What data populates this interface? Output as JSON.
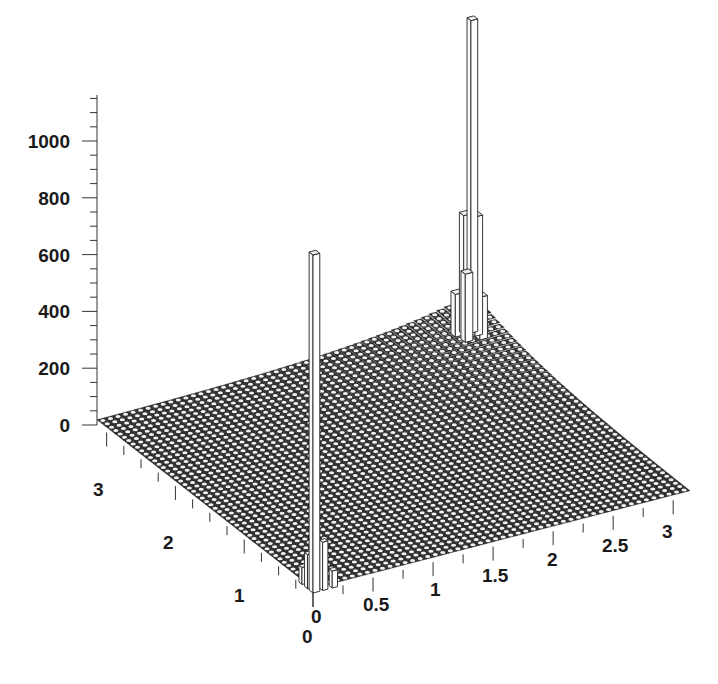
{
  "chart_data": {
    "type": "3d-histogram",
    "title": "",
    "xlabel": "",
    "ylabel": "",
    "zlabel": "",
    "x_axis": {
      "ticks": [
        0,
        0.5,
        1,
        1.5,
        2,
        2.5,
        3
      ],
      "range": [
        0,
        3.14
      ]
    },
    "y_axis": {
      "ticks": [
        0,
        1,
        2,
        3
      ],
      "range": [
        0,
        3.14
      ]
    },
    "z_axis": {
      "ticks": [
        0,
        200,
        400,
        600,
        800,
        1000
      ],
      "range": [
        0,
        1100
      ]
    },
    "grid_bins": [
      50,
      50
    ],
    "background_level": 15,
    "peaks": [
      {
        "name": "origin-spike",
        "x": 0.03,
        "y": 0.03,
        "height": 1190
      },
      {
        "name": "far-corner-spike",
        "x": 3.1,
        "y": 3.1,
        "height": 1100
      },
      {
        "name": "far-corner-neighbors",
        "x": 3.05,
        "y": 3.05,
        "height": 420
      },
      {
        "name": "far-corner-ring",
        "x": 3.0,
        "y": 3.0,
        "height": 200
      },
      {
        "name": "origin-neighbors",
        "x": 0.1,
        "y": 0.06,
        "height": 170
      }
    ],
    "colors": {
      "surface": "#2a2a2a",
      "cell": "#ffffff",
      "bar_fill": "#ffffff",
      "bar_edge": "#222222"
    }
  },
  "labels": {
    "z": [
      "0",
      "200",
      "400",
      "600",
      "800",
      "1000"
    ],
    "x": [
      "0",
      "0.5",
      "1",
      "1.5",
      "2",
      "2.5",
      "3"
    ],
    "y": [
      "0",
      "1",
      "2",
      "3"
    ]
  }
}
